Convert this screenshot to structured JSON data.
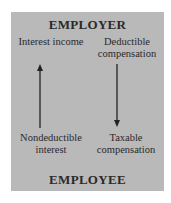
{
  "diagram": {
    "top_label": "EMPLOYER",
    "bottom_label": "EMPLOYEE",
    "left_top": "Interest income",
    "right_top": "Deductible compensation",
    "left_bottom": "Nondeductible interest",
    "right_bottom": "Taxable compensation",
    "arrows": [
      {
        "from": "employee",
        "to": "employer",
        "side": "left",
        "direction": "up"
      },
      {
        "from": "employer",
        "to": "employee",
        "side": "right",
        "direction": "down"
      }
    ],
    "colors": {
      "background": "#b9b9b9",
      "text": "#2a2a2a"
    }
  }
}
